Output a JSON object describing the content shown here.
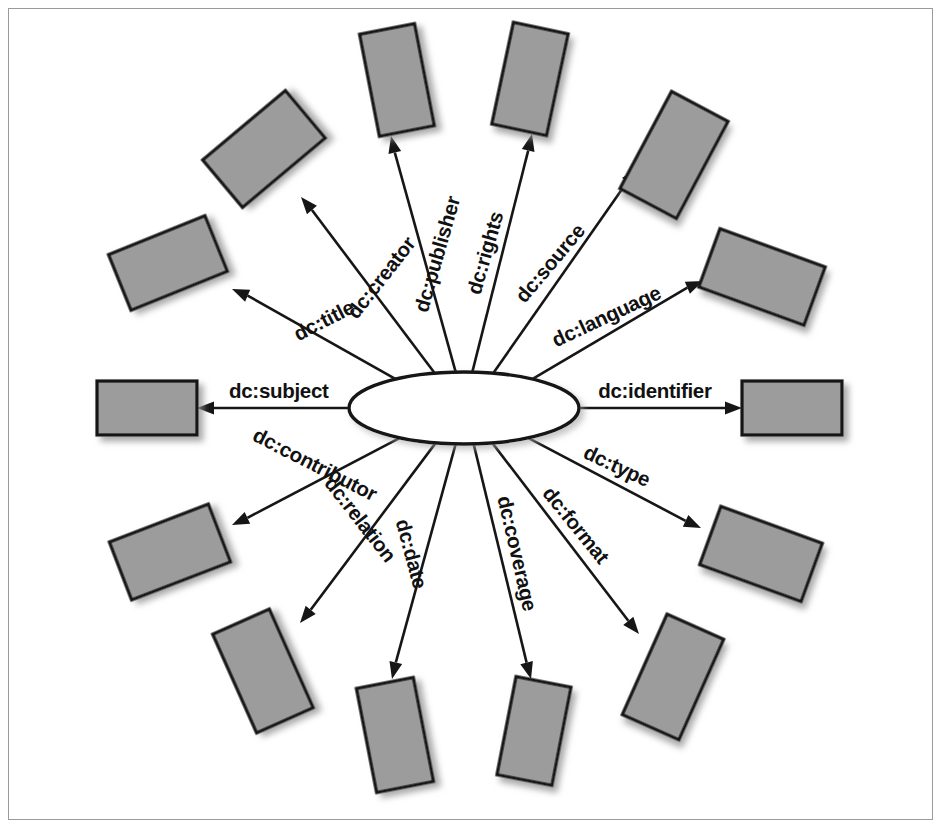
{
  "diagram": {
    "type": "radial-star",
    "center_node": {
      "name": "resource-hub",
      "label": "",
      "shape": "ellipse",
      "cx": 463,
      "cy": 407,
      "rx": 115,
      "ry": 36,
      "fill": "#ffffff",
      "stroke": "#141414"
    },
    "colors": {
      "node_fill": "#9c9c9c",
      "node_stroke": "#141414",
      "edge": "#161616",
      "frame": "#9b9b9b",
      "background": "#ffffff",
      "shadow": "#b9b9b9"
    },
    "edges": [
      {
        "label": "dc:subject",
        "angle": 180,
        "label_rotation": 0,
        "tip_x": 196,
        "tip_y": 407,
        "box": {
          "cx": 146,
          "cy": 407,
          "w": 100,
          "h": 54,
          "rot": 0
        }
      },
      {
        "label": "dc:title",
        "angle": 203,
        "label_rotation": -27,
        "tip_x": 231,
        "tip_y": 288,
        "box": {
          "cx": 167,
          "cy": 262,
          "w": 104,
          "h": 60,
          "rot": -22
        }
      },
      {
        "label": "dc:creator",
        "angle": 230,
        "label_rotation": -52,
        "tip_x": 300,
        "tip_y": 196,
        "box": {
          "cx": 263,
          "cy": 148,
          "w": 108,
          "h": 62,
          "rot": -40
        }
      },
      {
        "label": "dc:publisher",
        "angle": 257,
        "label_rotation": -74,
        "tip_x": 390,
        "tip_y": 135,
        "box": {
          "cx": 396,
          "cy": 79,
          "w": 56,
          "h": 104,
          "rot": -11
        }
      },
      {
        "label": "dc:rights",
        "angle": 283,
        "label_rotation": -74,
        "tip_x": 531,
        "tip_y": 133,
        "box": {
          "cx": 529,
          "cy": 78,
          "w": 56,
          "h": 104,
          "rot": 12
        }
      },
      {
        "label": "dc:source",
        "angle": 310,
        "label_rotation": -50,
        "tip_x": 637,
        "tip_y": 168,
        "box": {
          "cx": 673,
          "cy": 154,
          "w": 64,
          "h": 110,
          "rot": 28
        }
      },
      {
        "label": "dc:language",
        "angle": 337,
        "label_rotation": -25,
        "tip_x": 702,
        "tip_y": 280,
        "box": {
          "cx": 761,
          "cy": 276,
          "w": 112,
          "h": 62,
          "rot": 20
        }
      },
      {
        "label": "dc:identifier",
        "angle": 0,
        "label_rotation": 0,
        "tip_x": 741,
        "tip_y": 407,
        "box": {
          "cx": 791,
          "cy": 407,
          "w": 100,
          "h": 54,
          "rot": 0
        }
      },
      {
        "label": "dc:type",
        "angle": 25,
        "label_rotation": 25,
        "tip_x": 700,
        "tip_y": 527,
        "box": {
          "cx": 760,
          "cy": 553,
          "w": 108,
          "h": 62,
          "rot": 20
        }
      },
      {
        "label": "dc:format",
        "angle": 51,
        "label_rotation": 51,
        "tip_x": 638,
        "tip_y": 633,
        "box": {
          "cx": 672,
          "cy": 676,
          "w": 62,
          "h": 110,
          "rot": 24
        }
      },
      {
        "label": "dc:coverage",
        "angle": 75,
        "label_rotation": 77,
        "tip_x": 530,
        "tip_y": 678,
        "box": {
          "cx": 533,
          "cy": 730,
          "w": 56,
          "h": 100,
          "rot": 11
        }
      },
      {
        "label": "dc:date",
        "angle": 103,
        "label_rotation": 75,
        "tip_x": 391,
        "tip_y": 678,
        "box": {
          "cx": 394,
          "cy": 734,
          "w": 58,
          "h": 106,
          "rot": -11
        }
      },
      {
        "label": "dc:relation",
        "angle": 129,
        "label_rotation": 52,
        "tip_x": 299,
        "tip_y": 622,
        "box": {
          "cx": 262,
          "cy": 670,
          "w": 62,
          "h": 108,
          "rot": -24
        }
      },
      {
        "label": "dc:contributor",
        "angle": 155,
        "label_rotation": 27,
        "tip_x": 231,
        "tip_y": 524,
        "box": {
          "cx": 169,
          "cy": 551,
          "w": 106,
          "h": 62,
          "rot": -21
        }
      }
    ]
  }
}
